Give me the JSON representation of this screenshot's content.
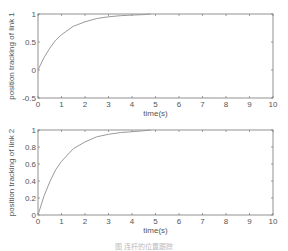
{
  "chart_data": [
    {
      "type": "line",
      "title": "",
      "xlabel": "time(s)",
      "ylabel": "position tracking of link 1",
      "xlim": [
        0,
        10
      ],
      "ylim": [
        -0.5,
        1
      ],
      "xticks": [
        "0",
        "1",
        "2",
        "3",
        "4",
        "5",
        "6",
        "7",
        "8",
        "9",
        "10"
      ],
      "yticks": [
        "-0.5",
        "0",
        "0.5",
        "1"
      ],
      "grid": false,
      "series": [
        {
          "name": "link 1",
          "x": [
            0,
            0.25,
            0.5,
            0.75,
            1,
            1.5,
            2,
            2.5,
            3,
            3.5,
            4,
            4.5,
            4.8
          ],
          "values": [
            0.0,
            0.22,
            0.39,
            0.53,
            0.63,
            0.78,
            0.86,
            0.92,
            0.95,
            0.97,
            0.98,
            0.99,
            1.0
          ]
        }
      ]
    },
    {
      "type": "line",
      "title": "",
      "xlabel": "time(s)",
      "ylabel": "position tracking of link 2",
      "xlim": [
        0,
        10
      ],
      "ylim": [
        0,
        1
      ],
      "xticks": [
        "0",
        "1",
        "2",
        "3",
        "4",
        "5",
        "6",
        "7",
        "8",
        "9",
        "10"
      ],
      "yticks": [
        "0",
        "0.2",
        "0.4",
        "0.6",
        "0.8",
        "1"
      ],
      "grid": false,
      "series": [
        {
          "name": "link 2",
          "x": [
            0,
            0.25,
            0.5,
            0.75,
            1,
            1.5,
            2,
            2.5,
            3,
            3.5,
            4,
            4.5,
            4.8
          ],
          "values": [
            0.0,
            0.22,
            0.39,
            0.53,
            0.63,
            0.78,
            0.86,
            0.92,
            0.95,
            0.97,
            0.98,
            0.99,
            1.0
          ]
        }
      ]
    }
  ],
  "caption": "图 连杆的位置跟踪",
  "colors": {
    "axis": "#777777",
    "line": "#9a9a9a",
    "text": "#555555"
  }
}
